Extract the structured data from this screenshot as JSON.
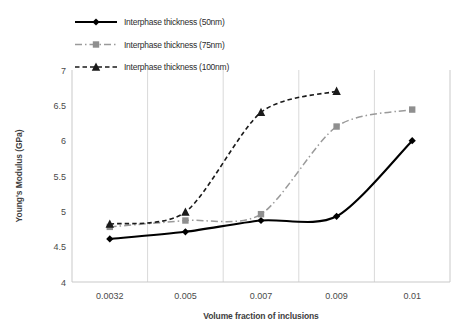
{
  "chart_data": {
    "type": "line",
    "title": "",
    "xlabel": "Volume fraction of inclusions",
    "ylabel": "Young's Modulus (GPa)",
    "categories": [
      "0.0032",
      "0.005",
      "0.007",
      "0.009",
      "0.01"
    ],
    "ytick_labels": [
      "4",
      "4.5",
      "5",
      "5.5",
      "6",
      "6.5",
      "7"
    ],
    "ylim": [
      4,
      7
    ],
    "ytick_step": 0.5,
    "grid": "vertical",
    "legend_position": "top-left",
    "series": [
      {
        "name": "Interphase thickness (50nm)",
        "marker": "diamond",
        "line_style": "solid",
        "color": "#000000",
        "values": [
          4.61,
          4.71,
          4.87,
          4.93,
          6.0
        ]
      },
      {
        "name": "Interphase thickness (75nm)",
        "marker": "square",
        "line_style": "dash-dot",
        "color": "#8f8f8f",
        "values": [
          4.78,
          4.87,
          4.96,
          6.2,
          6.44
        ]
      },
      {
        "name": "Interphase thickness (100nm)",
        "marker": "triangle",
        "line_style": "dashed",
        "color": "#1a1a1a",
        "values": [
          4.82,
          4.99,
          6.4,
          6.7,
          null
        ]
      }
    ]
  },
  "legend": {
    "items": [
      {
        "label": "Interphase thickness (50nm)"
      },
      {
        "label": "Interphase thickness (75nm)"
      },
      {
        "label": "Interphase thickness (100nm)"
      }
    ]
  },
  "axes": {
    "y_title": "Young's Modulus (GPa)",
    "x_title": "Volume fraction of inclusions",
    "y_ticks": [
      "7",
      "6.5",
      "6",
      "5.5",
      "5",
      "4.5",
      "4"
    ],
    "x_ticks": [
      "0.0032",
      "0.005",
      "0.007",
      "0.009",
      "0.01"
    ]
  }
}
